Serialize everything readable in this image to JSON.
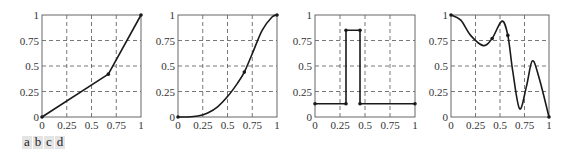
{
  "chart_data": [
    {
      "id": "a",
      "type": "line",
      "title": "",
      "xlabel": "",
      "ylabel": "",
      "xlim": [
        0,
        1
      ],
      "ylim": [
        0,
        1
      ],
      "xticks": [
        "0",
        "0.25",
        "0.5",
        "0.75",
        "1"
      ],
      "yticks": [
        "0",
        "0.25",
        "0.5",
        "0.75",
        "1"
      ],
      "grid": "dashed",
      "series": [
        {
          "name": "piecewise linear",
          "x": [
            0,
            0.67,
            1
          ],
          "y": [
            0,
            0.42,
            1
          ],
          "markers": true
        }
      ]
    },
    {
      "id": "b",
      "type": "line",
      "title": "",
      "xlabel": "",
      "ylabel": "",
      "xlim": [
        0,
        1
      ],
      "ylim": [
        0,
        1
      ],
      "xticks": [
        "0",
        "0.25",
        "0.5",
        "0.75",
        "1"
      ],
      "yticks": [
        "0",
        "0.25",
        "0.5",
        "0.75",
        "1"
      ],
      "grid": "dashed",
      "series": [
        {
          "name": "smooth S-curve",
          "x": [
            0,
            0.1,
            0.2,
            0.3,
            0.4,
            0.5,
            0.6,
            0.67,
            0.75,
            0.85,
            0.95,
            1
          ],
          "y": [
            0,
            0.0,
            0.01,
            0.04,
            0.1,
            0.2,
            0.33,
            0.44,
            0.62,
            0.85,
            0.98,
            1
          ],
          "markers": [
            0,
            0.67,
            1
          ]
        }
      ]
    },
    {
      "id": "c",
      "type": "line",
      "title": "",
      "xlabel": "",
      "ylabel": "",
      "xlim": [
        0,
        1
      ],
      "ylim": [
        0,
        1
      ],
      "xticks": [
        "0",
        "0.25",
        "0.5",
        "0.75",
        "1"
      ],
      "yticks": [
        "0",
        "0.25",
        "0.5",
        "0.75",
        "1"
      ],
      "grid": "dashed",
      "series": [
        {
          "name": "step pulse",
          "x": [
            0,
            0.31,
            0.31,
            0.45,
            0.45,
            1
          ],
          "y": [
            0.13,
            0.13,
            0.85,
            0.85,
            0.13,
            0.13
          ],
          "markers": true
        }
      ]
    },
    {
      "id": "d",
      "type": "line",
      "title": "",
      "xlabel": "",
      "ylabel": "",
      "xlim": [
        0,
        1
      ],
      "ylim": [
        0,
        1
      ],
      "xticks": [
        "0",
        "0.25",
        "0.5",
        "0.75",
        "1"
      ],
      "yticks": [
        "0",
        "0.25",
        "0.5",
        "0.75",
        "1"
      ],
      "grid": "dashed",
      "series": [
        {
          "name": "oscillating curve",
          "x": [
            0,
            0.1,
            0.2,
            0.33,
            0.42,
            0.52,
            0.58,
            0.63,
            0.7,
            0.77,
            0.83,
            0.9,
            1
          ],
          "y": [
            1,
            0.95,
            0.8,
            0.7,
            0.77,
            0.94,
            0.8,
            0.45,
            0.08,
            0.3,
            0.55,
            0.38,
            0
          ],
          "markers": [
            0,
            0.42,
            0.58,
            1
          ]
        }
      ]
    }
  ],
  "panel_labels": [
    "a",
    "b",
    "c",
    "d"
  ],
  "colors": {
    "line": "#1a1a1a",
    "grid": "#555555",
    "axes": "#666666",
    "label_bg": "#e4e4e4"
  }
}
